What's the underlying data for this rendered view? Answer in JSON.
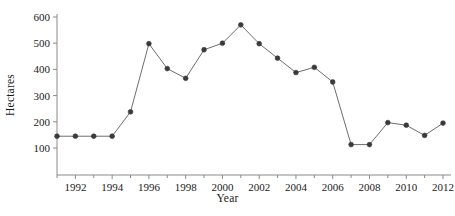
{
  "chart_data": {
    "type": "line",
    "title": "",
    "xlabel": "Year",
    "ylabel": "Hectares",
    "x": [
      1991,
      1992,
      1993,
      1994,
      1995,
      1996,
      1997,
      1998,
      1999,
      2000,
      2001,
      2002,
      2003,
      2004,
      2005,
      2006,
      2007,
      2008,
      2009,
      2010,
      2011,
      2012
    ],
    "values": [
      145,
      145,
      145,
      145,
      238,
      498,
      403,
      366,
      475,
      500,
      570,
      498,
      443,
      388,
      408,
      352,
      113,
      113,
      197,
      187,
      148,
      195
    ],
    "series": [
      {
        "name": "Hectares",
        "values": [
          145,
          145,
          145,
          145,
          238,
          498,
          403,
          366,
          475,
          500,
          570,
          498,
          443,
          388,
          408,
          352,
          113,
          113,
          197,
          187,
          148,
          195
        ]
      }
    ],
    "xlim": [
      1991,
      2012
    ],
    "ylim": [
      60,
      600
    ],
    "yticks": [
      100,
      200,
      300,
      400,
      500,
      600
    ],
    "ytick_labels": [
      "100",
      "200",
      "300",
      "400",
      "500",
      "600"
    ],
    "xticks": [
      1992,
      1994,
      1996,
      1998,
      2000,
      2002,
      2004,
      2006,
      2008,
      2010,
      2012
    ],
    "xtick_labels": [
      "1992",
      "1994",
      "1996",
      "1998",
      "2000",
      "2002",
      "2004",
      "2006",
      "2008",
      "2010",
      "2012"
    ],
    "xticks_minor": [
      1991,
      1993,
      1995,
      1997,
      1999,
      2001,
      2003,
      2005,
      2007,
      2009,
      2011
    ],
    "grid": false,
    "legend": null,
    "legend_position": "none",
    "marker": "circle",
    "line_color": "#6e6e6e",
    "marker_color": "#3a3a3a",
    "axis_color": "#8a8a8a",
    "background_color": "#ffffff"
  },
  "axes": {
    "y_axis_title": "Hectares",
    "x_axis_title": "Year"
  }
}
